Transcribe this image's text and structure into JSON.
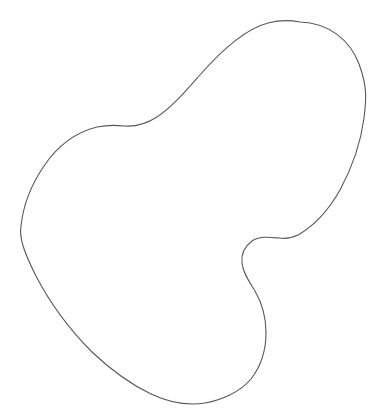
{
  "document": {
    "title": "Closed Freeform Blob Outline",
    "kind": "line-drawing",
    "description": "A single closed, smooth, hand-drawn style outline of an irregular bean or kidney shaped blob on a plain white background. No text, labels, axes or UI controls are visible."
  },
  "canvas": {
    "width": 378,
    "height": 416,
    "background_color": "#ffffff"
  },
  "shape": {
    "name": "blob-outline",
    "closed": true,
    "filled": false,
    "stroke_color": "#585858",
    "stroke_width": 1.1,
    "bounding_box": {
      "x_min": 21,
      "y_min": 21,
      "x_max": 366,
      "y_max": 405
    },
    "extreme_points": {
      "topmost": [
        300,
        22
      ],
      "rightmost": [
        365,
        108
      ],
      "bottommost": [
        192,
        404
      ],
      "leftmost": [
        21,
        230
      ]
    },
    "features": [
      "rounded top-right lobe peaking near x 300, y 22",
      "long convex right flank bulging out to x 365 near y 108",
      "concave S-shaped notch on the lower right pulling in to x 241 near y 258",
      "rounded lower-right lobe bulging to x 266 near y 335",
      "broad rounded bottom passing through x 192, y 404",
      "tall convex left flank reaching out to x 21 near y 230",
      "shallow inflection along the upper-left shoulder near x 120, y 126"
    ],
    "path": "M 300 22 C 329 23 350 40 359 64 C 368 88 366 101 364 118 C 361 141 353 166 340 190 C 327 213 312 227 298 235 C 292 238 286 239 279 238 C 268 237 259 236 252 241 C 244 247 241 254 242 263 C 243 273 249 281 255 291 C 262 303 266 318 266 333 C 266 350 261 366 251 379 C 240 392 222 400 205 403 C 186 406 168 402 151 394 C 130 384 110 369 92 352 C 70 330 50 303 36 276 C 24 252 19 238 21 226 C 23 207 31 185 44 166 C 58 145 77 132 97 127 C 107 125 116 125 124 126 C 136 127 146 124 157 117 C 172 107 184 93 199 76 C 220 52 245 29 268 23 C 279 20 290 20 300 22 Z"
  }
}
